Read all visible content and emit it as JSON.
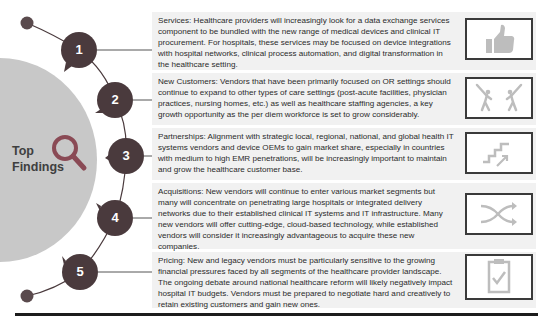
{
  "hub": {
    "title_line1": "Top",
    "title_line2": "Findings",
    "icon": "magnifier-icon",
    "color": "#c8c8c8"
  },
  "colors": {
    "node": "#4a3a3d",
    "accent": "#8a4a55",
    "panel_bg": "#f1f1f1",
    "icon_fill": "#bdbdbd"
  },
  "findings": [
    {
      "number": "1",
      "text": "Services: Healthcare providers will increasingly look for a data exchange services component to be bundled with the new range of medical devices and clinical IT procurement. For hospitals, these services may be focused on device integrations with hospital networks, clinical process automation, and digital transformation in the healthcare setting.",
      "icon": "thumbs-up-icon"
    },
    {
      "number": "2",
      "text": "New Customers: Vendors that have been primarily focused on OR settings should continue to expand to other types of care settings (post-acute facilities, physician practices, nursing homes, etc.) as well as healthcare staffing agencies, a key growth opportunity as the per diem workforce is set to grow considerably.",
      "icon": "golfers-icon"
    },
    {
      "number": "3",
      "text": "Partnerships: Alignment with strategic local, regional, national, and global health IT systems vendors and device OEMs to gain market share, especially in countries with medium to high EMR penetrations, will be increasingly important to maintain and grow the healthcare customer base.",
      "icon": "stairs-up-icon"
    },
    {
      "number": "4",
      "text": "Acquisitions: New vendors will continue to enter various market segments but many will concentrate on penetrating large hospitals or integrated delivery networks due to their established clinical IT systems and IT infrastructure. Many new vendors will offer cutting-edge, cloud-based technology, while established vendors will consider it increasingly advantageous to acquire these new companies.",
      "icon": "shuffle-icon"
    },
    {
      "number": "5",
      "text": "Pricing: New and legacy vendors must be particularly sensitive to the growing financial pressures faced by all segments of the healthcare provider landscape. The ongoing debate around national healthcare reform will likely negatively impact hospital IT budgets. Vendors must be prepared to negotiate hard and creatively to retain existing customers and gain new ones.",
      "icon": "clipboard-check-icon"
    }
  ]
}
